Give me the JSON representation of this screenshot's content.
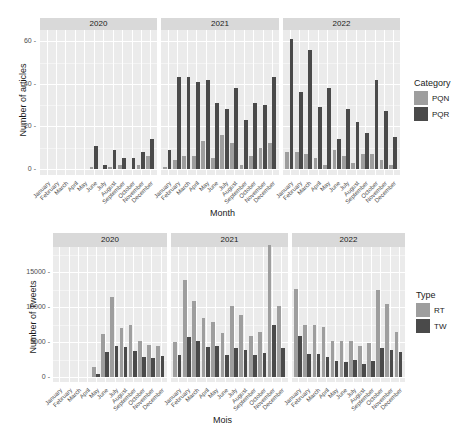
{
  "chart_data": [
    {
      "type": "bar",
      "title": "",
      "xlabel": "Month",
      "ylabel": "Number of articles",
      "ylim": [
        0,
        65
      ],
      "yticks": [
        0,
        20,
        40,
        60
      ],
      "legend": {
        "title": "Category",
        "position": "right"
      },
      "facets": [
        "2020",
        "2021",
        "2022"
      ],
      "categories": [
        "January",
        "February",
        "March",
        "April",
        "May",
        "June",
        "July",
        "August",
        "September",
        "October",
        "November",
        "December"
      ],
      "series_colors": {
        "PQN": "#9e9e9e",
        "PQR": "#4a4a4a"
      },
      "panels": [
        {
          "facet": "2020",
          "series": [
            {
              "name": "PQN",
              "values": [
                0,
                0,
                0,
                0,
                0,
                1,
                0,
                1,
                2,
                0,
                2,
                6
              ]
            },
            {
              "name": "PQR",
              "values": [
                0,
                0,
                0,
                0,
                0,
                11,
                2,
                9,
                5,
                5,
                8,
                14
              ]
            }
          ]
        },
        {
          "facet": "2021",
          "series": [
            {
              "name": "PQN",
              "values": [
                1,
                4,
                6,
                6,
                13,
                5,
                16,
                12,
                2,
                6,
                10,
                12
              ]
            },
            {
              "name": "PQR",
              "values": [
                9,
                43,
                43,
                41,
                42,
                31,
                28,
                38,
                23,
                31,
                30,
                43
              ]
            }
          ]
        },
        {
          "facet": "2022",
          "series": [
            {
              "name": "PQN",
              "values": [
                8,
                8,
                7,
                5,
                2,
                9,
                6,
                3,
                7,
                7,
                4,
                2
              ]
            },
            {
              "name": "PQR",
              "values": [
                61,
                36,
                56,
                29,
                38,
                14,
                28,
                22,
                17,
                42,
                27,
                15
              ]
            }
          ]
        }
      ]
    },
    {
      "type": "bar",
      "title": "",
      "xlabel": "Mois",
      "ylabel": "Number of Tweets",
      "ylim": [
        0,
        19500
      ],
      "yticks": [
        0,
        5000,
        10000,
        15000
      ],
      "legend": {
        "title": "Type",
        "position": "right"
      },
      "facets": [
        "2020",
        "2021",
        "2022"
      ],
      "categories": [
        "January",
        "February",
        "March",
        "April",
        "May",
        "June",
        "July",
        "August",
        "September",
        "October",
        "November",
        "December"
      ],
      "series_colors": {
        "RT": "#9e9e9e",
        "TW": "#4a4a4a"
      },
      "panels": [
        {
          "facet": "2020",
          "series": [
            {
              "name": "RT",
              "values": [
                0,
                0,
                0,
                0,
                1500,
                6200,
                11500,
                7000,
                7400,
                5200,
                4600,
                4400
              ]
            },
            {
              "name": "TW",
              "values": [
                0,
                0,
                0,
                0,
                400,
                3600,
                4500,
                4300,
                3700,
                2900,
                2700,
                3000
              ]
            }
          ]
        },
        {
          "facet": "2021",
          "series": [
            {
              "name": "RT",
              "values": [
                5000,
                13800,
                10800,
                8400,
                7800,
                6300,
                10100,
                8900,
                5800,
                6400,
                18800,
                10100
              ]
            },
            {
              "name": "TW",
              "values": [
                3100,
                5700,
                5200,
                4300,
                4500,
                3100,
                4200,
                3900,
                3100,
                3500,
                7500,
                4100
              ]
            }
          ]
        },
        {
          "facet": "2022",
          "series": [
            {
              "name": "RT",
              "values": [
                12600,
                7400,
                7400,
                7100,
                5100,
                5100,
                5100,
                4500,
                4800,
                12500,
                10400,
                6400
              ]
            },
            {
              "name": "TW",
              "values": [
                5900,
                3300,
                3300,
                2900,
                2300,
                2200,
                2400,
                1900,
                2300,
                4200,
                3800,
                3600
              ]
            }
          ]
        }
      ]
    }
  ]
}
